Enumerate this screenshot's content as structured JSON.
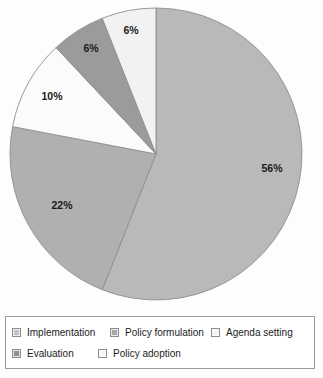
{
  "chart_data": {
    "type": "pie",
    "title": "",
    "subtitle": "",
    "xlabel": "",
    "ylabel": "",
    "grid": false,
    "legend_position": "bottom",
    "start_angle_deg": 0,
    "direction": "clockwise",
    "categories": [
      "Implementation",
      "Policy formulation",
      "Agenda setting",
      "Evaluation",
      "Policy adoption"
    ],
    "values": [
      56,
      22,
      10,
      6,
      6
    ],
    "value_unit": "%",
    "data_labels": [
      "56%",
      "22%",
      "10%",
      "6%",
      "6%"
    ],
    "slices": [
      {
        "label": "Implementation",
        "value": 56,
        "data_label": "56%",
        "color": "#b9b9b9",
        "label_x": 272,
        "label_y": 172
      },
      {
        "label": "Policy formulation",
        "value": 22,
        "data_label": "22%",
        "color": "#b0b0b0",
        "label_x": 62,
        "label_y": 209
      },
      {
        "label": "Agenda setting",
        "value": 10,
        "data_label": "10%",
        "color": "#fbfbfb",
        "label_x": 52,
        "label_y": 100
      },
      {
        "label": "Evaluation",
        "value": 6,
        "data_label": "6%",
        "color": "#9b9b9b",
        "label_x": 91,
        "label_y": 52
      },
      {
        "label": "Policy adoption",
        "value": 6,
        "data_label": "6%",
        "color": "#f2f2f2",
        "label_x": 131,
        "label_y": 34
      }
    ],
    "geometry": {
      "cx": 156,
      "cy": 154,
      "r": 146
    },
    "stroke_color": "#8f8f8f"
  },
  "legend": {
    "rows": [
      [
        {
          "label": "Implementation",
          "color": "#c3c3c3"
        },
        {
          "label": "Policy formulation",
          "color": "#a8a8a8"
        },
        {
          "label": "Agenda setting",
          "color": "#f4f4f4"
        }
      ],
      [
        {
          "label": "Evaluation",
          "color": "#909090"
        },
        {
          "label": "Policy adoption",
          "color": "#f7f7f7"
        }
      ]
    ]
  }
}
